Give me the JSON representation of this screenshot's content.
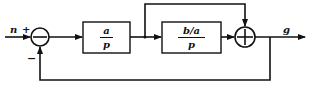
{
  "diagram": {
    "type": "control-block-diagram",
    "input_label": "n",
    "output_label": "g",
    "sum1": {
      "plus_sign": "+",
      "minus_sign": "−",
      "inner_symbol": "−"
    },
    "sum2": {
      "inner_symbol": "+"
    },
    "block1": {
      "numerator": "a",
      "denominator": "p"
    },
    "block2": {
      "numerator": "b/a",
      "denominator": "p"
    },
    "colors": {
      "stroke": "#111111",
      "background": "#ffffff"
    }
  }
}
